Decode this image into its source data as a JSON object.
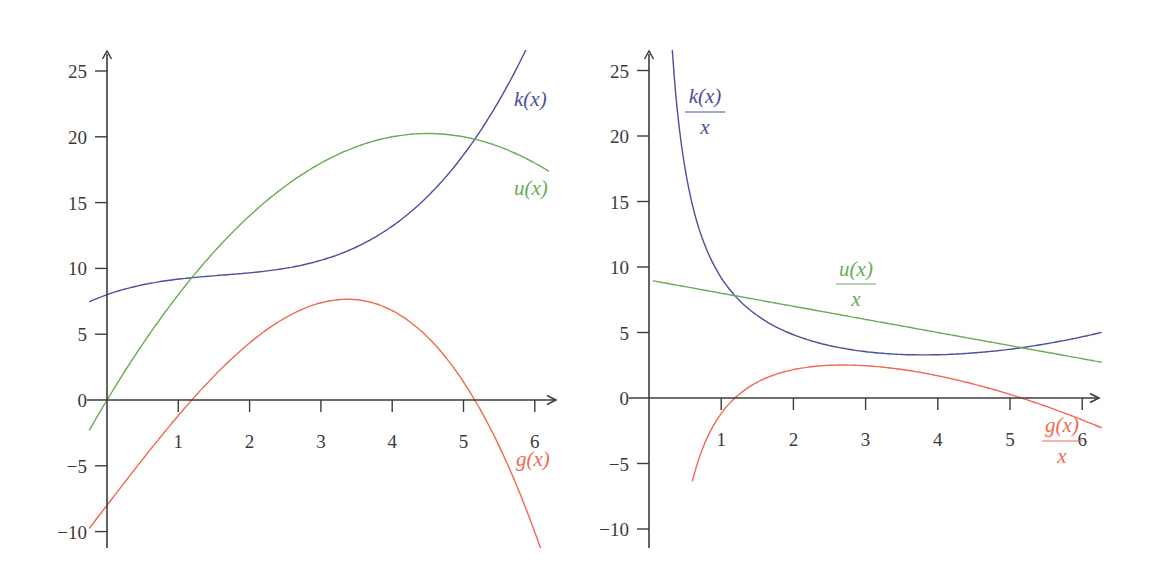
{
  "chart_data": [
    {
      "id": "left",
      "type": "line",
      "title": "",
      "xlabel": "",
      "ylabel": "",
      "xlim": [
        0,
        6.25
      ],
      "ylim": [
        -11.5,
        26.5
      ],
      "grid": false,
      "x_ticks": [
        1,
        2,
        3,
        4,
        5,
        6
      ],
      "x_tick_labels": [
        "1",
        "2",
        "3",
        "4",
        "5",
        "6"
      ],
      "y_ticks": [
        -10,
        -5,
        0,
        5,
        10,
        15,
        20,
        25
      ],
      "y_tick_labels": [
        "−10",
        "−5",
        "0",
        "5",
        "10",
        "15",
        "20",
        "25"
      ],
      "legend_position": "inline labels near curves",
      "x": [
        0,
        0.5,
        1,
        1.5,
        2,
        2.5,
        3,
        3.5,
        4,
        4.5,
        5,
        5.5,
        6
      ],
      "series": [
        {
          "name": "k(x)",
          "label_num": "k(x)",
          "label_den": "",
          "color": "#4a509a",
          "values": [
            8.0,
            8.7,
            9.2,
            9.4,
            9.6,
            9.9,
            10.4,
            11.4,
            13.0,
            15.5,
            19.0,
            23.7,
            29.7
          ]
        },
        {
          "name": "u(x)",
          "label_num": "u(x)",
          "label_den": "",
          "color": "#6aaa58",
          "values": [
            0.0,
            4.25,
            8.0,
            11.25,
            14.0,
            16.25,
            18.0,
            19.25,
            20.0,
            20.25,
            20.0,
            19.25,
            18.0
          ]
        },
        {
          "name": "g(x)",
          "label_num": "g(x)",
          "label_den": "",
          "color": "#ee6a52",
          "values": [
            -8.0,
            -4.45,
            -1.2,
            1.85,
            4.4,
            6.35,
            7.6,
            7.85,
            7.0,
            4.75,
            1.0,
            -4.45,
            -11.7
          ]
        }
      ]
    },
    {
      "id": "right",
      "type": "line",
      "title": "",
      "xlabel": "",
      "ylabel": "",
      "xlim": [
        0,
        6.25
      ],
      "ylim": [
        -11.5,
        26.5
      ],
      "grid": false,
      "x_ticks": [
        1,
        2,
        3,
        4,
        5,
        6
      ],
      "x_tick_labels": [
        "1",
        "2",
        "3",
        "4",
        "5",
        "6"
      ],
      "y_ticks": [
        -10,
        -5,
        0,
        5,
        10,
        15,
        20,
        25
      ],
      "y_tick_labels": [
        "−10",
        "−5",
        "0",
        "5",
        "10",
        "15",
        "20",
        "25"
      ],
      "legend_position": "inline labels near curves",
      "x": [
        0.5,
        1,
        1.5,
        2,
        2.5,
        3,
        3.5,
        4,
        4.5,
        5,
        5.5,
        6
      ],
      "series": [
        {
          "name": "k(x)/x",
          "label_num": "k(x)",
          "label_den": "x",
          "color": "#4a509a",
          "values": [
            17.4,
            9.2,
            6.27,
            4.8,
            3.96,
            3.47,
            3.26,
            3.25,
            3.44,
            3.8,
            4.31,
            4.95
          ]
        },
        {
          "name": "u(x)/x",
          "label_num": "u(x)",
          "label_den": "x",
          "color": "#6aaa58",
          "values": [
            8.5,
            8.0,
            7.5,
            7.0,
            6.5,
            6.0,
            5.5,
            5.0,
            4.5,
            4.0,
            3.5,
            3.0
          ]
        },
        {
          "name": "g(x)/x",
          "label_num": "g(x)",
          "label_den": "x",
          "color": "#ee6a52",
          "values": [
            -8.9,
            -1.2,
            1.23,
            2.2,
            2.54,
            2.53,
            2.24,
            1.75,
            1.06,
            0.2,
            -0.81,
            -1.95
          ]
        }
      ]
    }
  ],
  "panels": {
    "left": {
      "labels": {
        "k": "k(x)",
        "u": "u(x)",
        "g": "g(x)"
      }
    },
    "right": {
      "labels": {
        "k_num": "k(x)",
        "k_den": "x",
        "u_num": "u(x)",
        "u_den": "x",
        "g_num": "g(x)",
        "g_den": "x"
      }
    }
  }
}
